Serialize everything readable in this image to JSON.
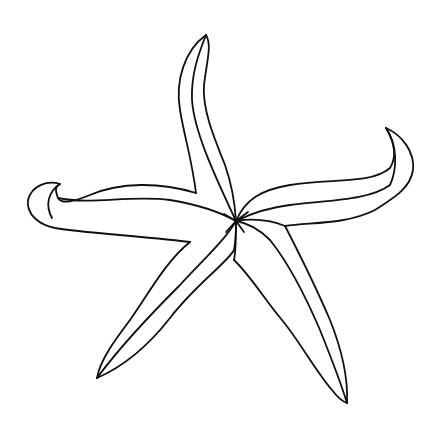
{
  "image": {
    "subject": "starfish line drawing",
    "background": "#ffffff",
    "stroke_color": "#111111",
    "stroke_width": 1.8,
    "center": [
      236,
      221
    ]
  },
  "arms": [
    {
      "name": "top-arm",
      "tip": [
        206,
        35
      ]
    },
    {
      "name": "left-arm",
      "tip": [
        28,
        200
      ]
    },
    {
      "name": "right-arm",
      "tip": [
        386,
        128
      ]
    },
    {
      "name": "bottom-left-arm",
      "tip": [
        97,
        378
      ]
    },
    {
      "name": "bottom-right-arm",
      "tip": [
        347,
        403
      ]
    }
  ]
}
